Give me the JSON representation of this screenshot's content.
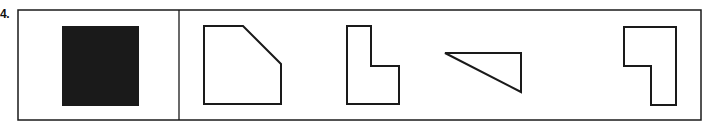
{
  "question": {
    "number_label": "4."
  },
  "figure": {
    "stroke_color": "#1a1a1a",
    "fill_color": "#1a1a1a",
    "frame": {
      "x": 18,
      "y": 10,
      "width": 683,
      "height": 110
    },
    "divider_x": 179,
    "reference_shape": {
      "name": "filled-square",
      "x": 62,
      "y": 26,
      "width": 77,
      "height": 80
    },
    "options": [
      {
        "name": "pentagon-cut-corner",
        "points": "204,26 243,26 281,64 281,104 204,104"
      },
      {
        "name": "l-shape",
        "points": "347,26 371,26 371,66 399,66 399,104 347,104"
      },
      {
        "name": "right-triangle",
        "points": "445,53 521,53 521,92"
      },
      {
        "name": "mirrored-l-shape",
        "points": "624,27 676,27 676,105 651,105 651,66 624,66"
      }
    ]
  }
}
